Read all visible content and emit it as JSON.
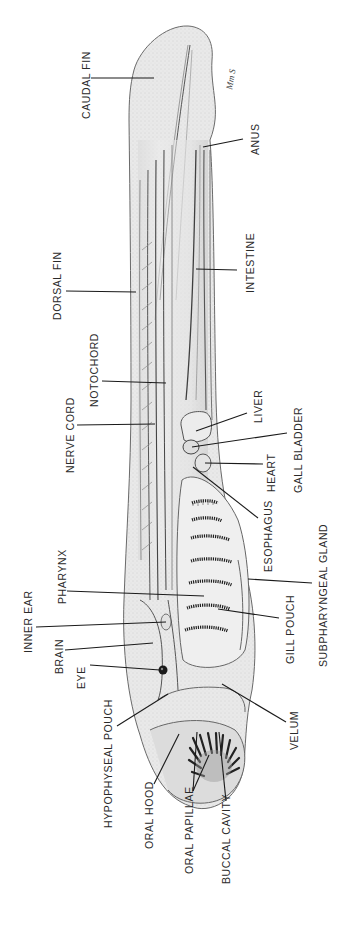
{
  "figure": {
    "signature": "Mm S",
    "colors": {
      "ink": "#2a2a2a",
      "body_fill": "#e6e6e6",
      "body_shade": "#cfcfcf",
      "background": "#ffffff"
    }
  },
  "labels": [
    {
      "id": "caudal-fin",
      "text": "CAUDAL FIN",
      "x": 81,
      "y": 119
    },
    {
      "id": "anus",
      "text": "ANUS",
      "x": 250,
      "y": 155
    },
    {
      "id": "dorsal-fin",
      "text": "DORSAL FIN",
      "x": 52,
      "y": 320
    },
    {
      "id": "intestine",
      "text": "INTESTINE",
      "x": 245,
      "y": 293
    },
    {
      "id": "notochord",
      "text": "NOTOCHORD",
      "x": 89,
      "y": 407
    },
    {
      "id": "nerve-cord",
      "text": "NERVE CORD",
      "x": 65,
      "y": 473
    },
    {
      "id": "liver",
      "text": "LIVER",
      "x": 253,
      "y": 423
    },
    {
      "id": "gall-bladder",
      "text": "GALL BLADDER",
      "x": 293,
      "y": 493
    },
    {
      "id": "heart",
      "text": "HEART",
      "x": 266,
      "y": 492
    },
    {
      "id": "esophagus",
      "text": "ESOPHAGUS",
      "x": 263,
      "y": 572
    },
    {
      "id": "pharynx",
      "text": "PHARYNX",
      "x": 57,
      "y": 604
    },
    {
      "id": "subpharyngeal-gland",
      "text": "SUBPHARYNGEAL GLAND",
      "x": 318,
      "y": 667
    },
    {
      "id": "inner-ear",
      "text": "INNER EAR",
      "x": 23,
      "y": 653
    },
    {
      "id": "gill-pouch",
      "text": "GILL POUCH",
      "x": 285,
      "y": 664
    },
    {
      "id": "brain",
      "text": "BRAIN",
      "x": 54,
      "y": 674
    },
    {
      "id": "eye",
      "text": "EYE",
      "x": 76,
      "y": 689
    },
    {
      "id": "velum",
      "text": "VELUM",
      "x": 289,
      "y": 750
    },
    {
      "id": "hypophyseal-pouch",
      "text": "HYPOPHYSEAL POUCH",
      "x": 103,
      "y": 828
    },
    {
      "id": "oral-hood",
      "text": "ORAL HOOD",
      "x": 144,
      "y": 849
    },
    {
      "id": "oral-papillae",
      "text": "ORAL PAPILLAE",
      "x": 184,
      "y": 874
    },
    {
      "id": "buccal-cavity",
      "text": "BUCCAL CAVITY",
      "x": 221,
      "y": 884
    }
  ],
  "leaders": [
    {
      "id": "caudal-fin",
      "points": [
        [
          91,
          78
        ],
        [
          154,
          78
        ]
      ]
    },
    {
      "id": "anus",
      "points": [
        [
          243,
          139
        ],
        [
          203,
          147
        ]
      ]
    },
    {
      "id": "dorsal-fin",
      "points": [
        [
          66,
          291
        ],
        [
          136,
          292
        ]
      ]
    },
    {
      "id": "intestine",
      "points": [
        [
          237,
          270
        ],
        [
          196,
          269
        ]
      ]
    },
    {
      "id": "notochord",
      "points": [
        [
          102,
          381
        ],
        [
          166,
          383
        ]
      ]
    },
    {
      "id": "nerve-cord",
      "points": [
        [
          77,
          425
        ],
        [
          155,
          424
        ]
      ]
    },
    {
      "id": "liver",
      "points": [
        [
          247,
          413
        ],
        [
          196,
          431
        ]
      ]
    },
    {
      "id": "gall-bladder",
      "points": [
        [
          287,
          433
        ],
        [
          192,
          447
        ]
      ]
    },
    {
      "id": "heart",
      "points": [
        [
          263,
          464
        ],
        [
          205,
          463
        ]
      ]
    },
    {
      "id": "esophagus",
      "points": [
        [
          258,
          518
        ],
        [
          193,
          467
        ]
      ]
    },
    {
      "id": "pharynx",
      "points": [
        [
          67,
          591
        ],
        [
          204,
          596
        ]
      ]
    },
    {
      "id": "subpharyngeal-gland",
      "points": [
        [
          312,
          583
        ],
        [
          248,
          579
        ]
      ]
    },
    {
      "id": "inner-ear",
      "points": [
        [
          36,
          627
        ],
        [
          166,
          622
        ]
      ]
    },
    {
      "id": "gill-pouch",
      "points": [
        [
          279,
          618
        ],
        [
          218,
          609
        ]
      ]
    },
    {
      "id": "brain",
      "points": [
        [
          65,
          650
        ],
        [
          153,
          643
        ]
      ]
    },
    {
      "id": "eye",
      "points": [
        [
          90,
          665
        ],
        [
          160,
          670
        ]
      ]
    },
    {
      "id": "velum",
      "points": [
        [
          286,
          722
        ],
        [
          222,
          684
        ]
      ]
    },
    {
      "id": "hypophyseal-pouch",
      "points": [
        [
          117,
          726
        ],
        [
          168,
          694
        ]
      ]
    },
    {
      "id": "oral-hood",
      "points": [
        [
          154,
          784
        ],
        [
          179,
          734
        ]
      ]
    },
    {
      "id": "oral-papillae",
      "points": [
        [
          193,
          791
        ],
        [
          197,
          732
        ]
      ]
    },
    {
      "id": "oral-papillae-2",
      "points": [
        [
          193,
          791
        ],
        [
          209,
          755
        ]
      ]
    },
    {
      "id": "buccal-cavity",
      "points": [
        [
          226,
          801
        ],
        [
          219,
          732
        ]
      ]
    }
  ]
}
